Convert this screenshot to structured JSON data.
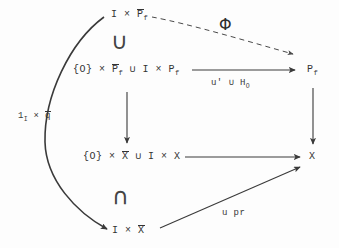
{
  "figure": {
    "kind": "commutative-diagram",
    "background_color": "#fdfdfd",
    "ink_color": "#333333"
  },
  "nodes": {
    "top": "I × P̄_f",
    "mid_upper": "{O} × P̄_f ∪ I × P_f",
    "mid_lower": "{O} × X̄ ∪ I × X",
    "bottom": "I × X̄",
    "right_top": "P_f",
    "right_bottom": "X"
  },
  "edge_labels": {
    "phi": "Φ",
    "u_prime_union_h": "u' ∪ H_O",
    "one_times_qbar": "1_I × q̄",
    "u_pr": "u pr"
  },
  "inclusion_symbols": {
    "upper": "∪",
    "lower": "∩"
  },
  "edges": [
    {
      "name": "phi-dashed-arrow",
      "from": "top",
      "to": "right_top",
      "style": "dashed",
      "label": "Φ"
    },
    {
      "name": "u-prime-arrow",
      "from": "mid_upper",
      "to": "right_top",
      "style": "solid",
      "label": "u' ∪ H_O"
    },
    {
      "name": "vertical-left-arrow",
      "from": "mid_upper",
      "to": "mid_lower",
      "style": "solid",
      "label": ""
    },
    {
      "name": "vertical-right-arrow",
      "from": "right_top",
      "to": "right_bottom",
      "style": "solid",
      "label": ""
    },
    {
      "name": "middle-horizontal-arrow",
      "from": "mid_lower",
      "to": "right_bottom",
      "style": "solid",
      "label": ""
    },
    {
      "name": "u-pr-arrow",
      "from": "bottom",
      "to": "right_bottom",
      "style": "solid",
      "label": "u pr"
    },
    {
      "name": "curved-left-arrow",
      "from": "top",
      "to": "bottom",
      "style": "curved",
      "label": "1_I × q̄"
    }
  ]
}
